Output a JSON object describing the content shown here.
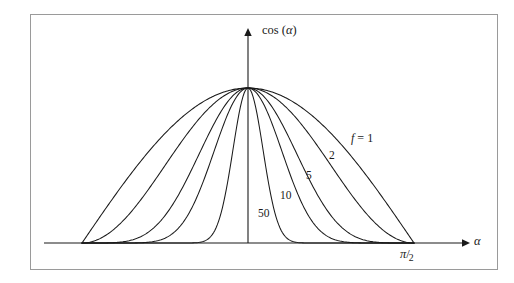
{
  "figure": {
    "background_color": "#ffffff",
    "frame_color": "#9a9a9a",
    "curve_color": "#1a1a1a",
    "axes": {
      "y_axis_label": "cos (",
      "y_axis_label_greek": "α",
      "y_axis_label_close": ")",
      "x_axis_label": "α",
      "x_tick_numerator": "π",
      "x_tick_slash": "/",
      "x_tick_denominator": "2"
    },
    "curve_labels": [
      {
        "id": "f1",
        "prefix": "f",
        "equals": " = ",
        "value": "1"
      },
      {
        "id": "f2",
        "value": "2"
      },
      {
        "id": "f5",
        "value": "5"
      },
      {
        "id": "f10",
        "value": "10"
      },
      {
        "id": "f50",
        "value": "50"
      }
    ]
  },
  "chart_data": {
    "type": "line",
    "title": "",
    "xlabel": "α",
    "ylabel": "cos (α)",
    "xlim": [
      -1.5707963,
      1.5707963
    ],
    "ylim": [
      0,
      1
    ],
    "xticks": [
      1.5707963
    ],
    "xticklabels": [
      "π/2"
    ],
    "yticks": [],
    "yticklabels": [],
    "grid": false,
    "legend": "inline-curve-labels",
    "series": [
      {
        "name": "f = 1",
        "exponent": 1,
        "label": "f = 1",
        "x": [
          -1.5707963,
          -1.4137167,
          -1.2566371,
          -1.0995574,
          -0.9424778,
          -0.7853982,
          -0.6283185,
          -0.4712389,
          -0.3141593,
          -0.1570796,
          0,
          0.1570796,
          0.3141593,
          0.4712389,
          0.6283185,
          0.7853982,
          0.9424778,
          1.0995574,
          1.2566371,
          1.4137167,
          1.5707963
        ],
        "y": [
          0,
          0.156,
          0.309,
          0.454,
          0.588,
          0.707,
          0.809,
          0.891,
          0.951,
          0.988,
          1,
          0.988,
          0.951,
          0.891,
          0.809,
          0.707,
          0.588,
          0.454,
          0.309,
          0.156,
          0
        ]
      },
      {
        "name": "2",
        "exponent": 2,
        "label": "2",
        "x": [
          -1.5707963,
          -1.4137167,
          -1.2566371,
          -1.0995574,
          -0.9424778,
          -0.7853982,
          -0.6283185,
          -0.4712389,
          -0.3141593,
          -0.1570796,
          0,
          0.1570796,
          0.3141593,
          0.4712389,
          0.6283185,
          0.7853982,
          0.9424778,
          1.0995574,
          1.2566371,
          1.4137167,
          1.5707963
        ],
        "y": [
          0,
          0.024,
          0.095,
          0.206,
          0.345,
          0.5,
          0.655,
          0.794,
          0.905,
          0.976,
          1,
          0.976,
          0.905,
          0.794,
          0.655,
          0.5,
          0.345,
          0.206,
          0.095,
          0.024,
          0
        ]
      },
      {
        "name": "5",
        "exponent": 5,
        "label": "5",
        "x": [
          -1.5707963,
          -1.4137167,
          -1.2566371,
          -1.0995574,
          -0.9424778,
          -0.7853982,
          -0.6283185,
          -0.4712389,
          -0.3141593,
          -0.1570796,
          0,
          0.1570796,
          0.3141593,
          0.4712389,
          0.6283185,
          0.7853982,
          0.9424778,
          1.0995574,
          1.2566371,
          1.4137167,
          1.5707963
        ],
        "y": [
          0,
          0.0001,
          0.0028,
          0.0193,
          0.0706,
          0.1768,
          0.3457,
          0.5613,
          0.778,
          0.9411,
          1,
          0.9411,
          0.778,
          0.5613,
          0.3457,
          0.1768,
          0.0706,
          0.0193,
          0.0028,
          0.0001,
          0
        ]
      },
      {
        "name": "10",
        "exponent": 10,
        "label": "10",
        "x": [
          -1.5707963,
          -1.4137167,
          -1.2566371,
          -1.0995574,
          -0.9424778,
          -0.7853982,
          -0.6283185,
          -0.4712389,
          -0.3141593,
          -0.1570796,
          0,
          0.1570796,
          0.3141593,
          0.4712389,
          0.6283185,
          0.7853982,
          0.9424778,
          1.0995574,
          1.2566371,
          1.4137167,
          1.5707963
        ],
        "y": [
          0,
          0,
          7.7e-06,
          0.00037,
          0.005,
          0.0313,
          0.1195,
          0.3151,
          0.6053,
          0.8857,
          1,
          0.8857,
          0.6053,
          0.3151,
          0.1195,
          0.0313,
          0.005,
          0.00037,
          7.7e-06,
          0,
          0
        ]
      },
      {
        "name": "50",
        "exponent": 50,
        "label": "50",
        "x": [
          -1.5707963,
          -1.4137167,
          -1.2566371,
          -1.0995574,
          -0.9424778,
          -0.7853982,
          -0.6283185,
          -0.4712389,
          -0.3141593,
          -0.1570796,
          0,
          0.1570796,
          0.3141593,
          0.4712389,
          0.6283185,
          0.7853982,
          0.9424778,
          1.0995574,
          1.2566371,
          1.4137167,
          1.5707963
        ],
        "y": [
          0,
          0,
          0,
          0,
          0,
          9e-10,
          2.49e-05,
          0.0031,
          0.081,
          0.5466,
          1,
          0.5466,
          0.081,
          0.0031,
          2.49e-05,
          9e-10,
          0,
          0,
          0,
          0,
          0
        ]
      }
    ]
  }
}
